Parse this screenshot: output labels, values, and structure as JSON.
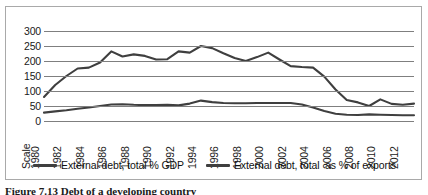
{
  "figure": {
    "caption": "Figure  7.13    Debt of a developing country"
  },
  "chart_data": {
    "type": "line",
    "title": "",
    "xlabel": "",
    "ylabel": "",
    "ylim": [
      0,
      300
    ],
    "ytick_step": 50,
    "ytick_labels": [
      "300",
      "250",
      "200",
      "150",
      "100",
      "50",
      "0"
    ],
    "grid": true,
    "legend_position": "bottom",
    "x_axis_first_label": "Scale",
    "categories": [
      "1980",
      "1981",
      "1982",
      "1983",
      "1984",
      "1985",
      "1986",
      "1987",
      "1988",
      "1989",
      "1990",
      "1991",
      "1992",
      "1993",
      "1994",
      "1995",
      "1996",
      "1997",
      "1998",
      "1999",
      "2000",
      "2001",
      "2002",
      "2003",
      "2004",
      "2005",
      "2006",
      "2007",
      "2008",
      "2009",
      "2010",
      "2011",
      "2012",
      "2013"
    ],
    "tick_labels": [
      "Scale",
      "1980",
      "1982",
      "1984",
      "1986",
      "1988",
      "1990",
      "1992",
      "1994",
      "1996",
      "1998",
      "2000",
      "2002",
      "2004",
      "2006",
      "2008",
      "2010",
      "2012"
    ],
    "series": [
      {
        "name": "External debt, total % GDP",
        "color": "#3f3f3f",
        "values": [
          28,
          32,
          36,
          41,
          45,
          50,
          55,
          56,
          54,
          53,
          53,
          54,
          52,
          58,
          68,
          63,
          60,
          59,
          59,
          60,
          60,
          60,
          60,
          55,
          45,
          33,
          24,
          21,
          20,
          22,
          21,
          20,
          19,
          19
        ]
      },
      {
        "name": "External debt, total  as % of exports",
        "color": "#3f3f3f",
        "values": [
          80,
          120,
          150,
          175,
          178,
          195,
          232,
          215,
          222,
          217,
          205,
          206,
          232,
          228,
          250,
          243,
          226,
          210,
          200,
          213,
          228,
          205,
          183,
          180,
          178,
          148,
          105,
          70,
          62,
          50,
          72,
          57,
          54,
          58
        ]
      }
    ]
  },
  "legend": {
    "items": [
      {
        "label": "External debt, total % GDP"
      },
      {
        "label": "External debt, total  as % of exports"
      }
    ]
  }
}
